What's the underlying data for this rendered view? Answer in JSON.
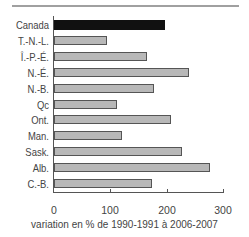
{
  "chart_data": {
    "type": "bar",
    "orientation": "horizontal",
    "title": "",
    "xlabel": "variation en % de 1990-1991 à 2006-2007",
    "ylabel": "",
    "xlim": [
      0,
      300
    ],
    "xticks": [
      0,
      100,
      200,
      300
    ],
    "xtick_labels": [
      "0",
      "100",
      "200",
      "300"
    ],
    "grid": false,
    "legend": null,
    "categories": [
      "Canada",
      "T.-N.-L.",
      "Î.-P.-É.",
      "N.-É.",
      "N.-B.",
      "Qc",
      "Ont.",
      "Man.",
      "Sask.",
      "Alb.",
      "C.-B."
    ],
    "values": [
      197,
      94,
      165,
      240,
      178,
      112,
      208,
      121,
      227,
      277,
      174
    ],
    "highlight_category": "Canada",
    "colors": {
      "highlight": "#111111",
      "default": "#b8b8b8",
      "border": "#555555",
      "top_rule": "#a0a0a0"
    }
  }
}
